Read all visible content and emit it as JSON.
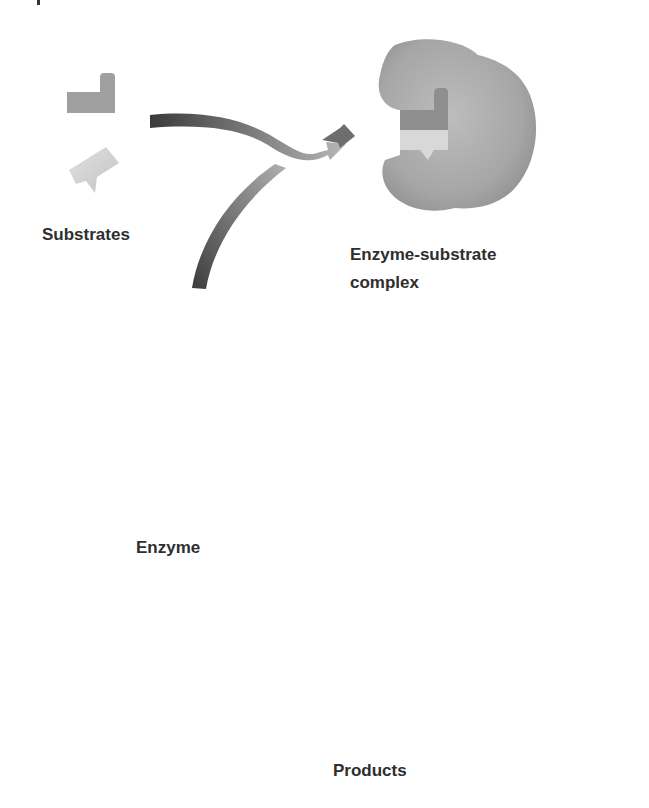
{
  "diagram": {
    "labels": {
      "substrates": "Substrates",
      "complex_line1": "Enzyme-substrate",
      "complex_line2": "complex",
      "enzyme": "Enzyme",
      "products": "Products"
    },
    "nodes": [
      {
        "id": "substrates",
        "label": "Substrates",
        "shapes": [
          "L-shaped substrate (mid gray)",
          "wedge substrate (light gray)"
        ]
      },
      {
        "id": "complex",
        "label": "Enzyme-substrate complex"
      },
      {
        "id": "complex-after",
        "label": "",
        "note": "enzyme with converted products bound"
      },
      {
        "id": "enzyme",
        "label": "Enzyme"
      },
      {
        "id": "products",
        "label": "Products",
        "shapes": [
          "pointed product (light gray)",
          "notched product (light gray)"
        ]
      }
    ],
    "arrows": [
      {
        "from": "substrates",
        "to": "complex"
      },
      {
        "from": "enzyme",
        "to": "complex"
      },
      {
        "from": "complex",
        "to": "complex-after"
      },
      {
        "from": "complex-after",
        "to": "enzyme"
      },
      {
        "from": "complex-after",
        "to": "products"
      }
    ],
    "colors": {
      "background": "#ffffff",
      "text": "#2e2e2e",
      "enzyme_fill": "#a9a9a9",
      "enzyme_shade": "#8c8c8c",
      "arrow_dark": "#3c3c3c",
      "arrow_light": "#b4b4b4",
      "substrate_mid": "#9d9d9d",
      "substrate_light": "#d2d2d2"
    }
  }
}
